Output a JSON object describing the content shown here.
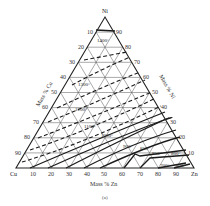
{
  "diagram": {
    "type": "ternary-phase-diagram",
    "vertices": {
      "top": "Ni",
      "left": "Cu",
      "right": "Zn"
    },
    "axes": {
      "bottom": {
        "title": "Mass % Zn",
        "ticks": [
          "10",
          "20",
          "30",
          "40",
          "50",
          "60",
          "70",
          "80",
          "90"
        ]
      },
      "left": {
        "title": "Mass % Cu",
        "ticks": [
          "10",
          "20",
          "30",
          "40",
          "50",
          "60",
          "70",
          "80",
          "90"
        ]
      },
      "right": {
        "title": "Mass % Ni",
        "ticks": [
          "90",
          "80",
          "70",
          "60",
          "50",
          "40",
          "30",
          "20",
          "10"
        ]
      }
    },
    "isotherms": [
      {
        "label": "1400°",
        "style": "solid"
      },
      {
        "label": "1300°",
        "style": "dashed"
      },
      {
        "label": "1200°",
        "style": "dashed"
      },
      {
        "label": "1100°",
        "style": "dashed"
      },
      {
        "label": "1000°",
        "style": "solid"
      },
      {
        "label": "900°",
        "style": "solid"
      },
      {
        "label": "850°",
        "style": "solid"
      },
      {
        "label": "850°",
        "style": "solid"
      },
      {
        "label": "800°",
        "style": "solid"
      },
      {
        "label": "700°",
        "style": "solid"
      },
      {
        "label": "600°",
        "style": "solid"
      }
    ],
    "caption": "(a)"
  }
}
